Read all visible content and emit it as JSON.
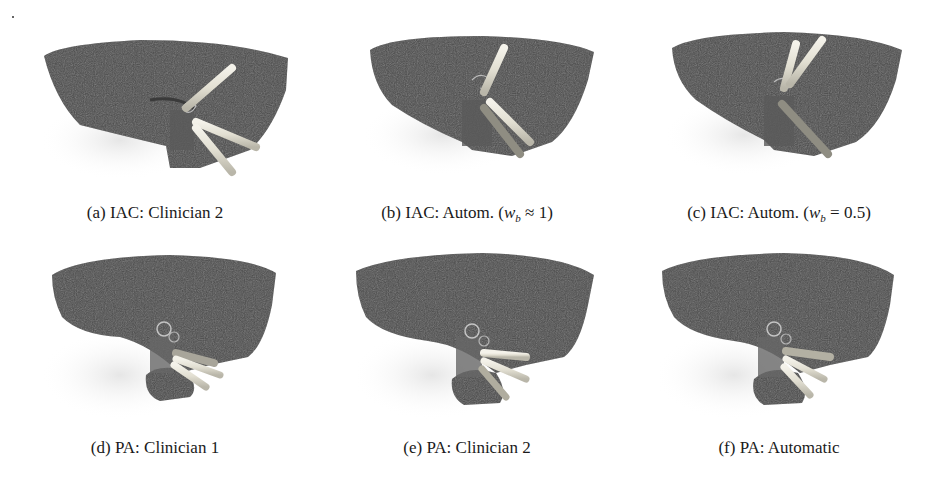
{
  "figure": {
    "panels": [
      {
        "id": "a",
        "label": "(a)",
        "text": "IAC: Clinician 2",
        "region": "IAC",
        "planner": "Clinician 2",
        "trajectory_count": 3
      },
      {
        "id": "b",
        "label": "(b)",
        "text": "IAC: Autom.",
        "math": "(w_b ≈ 1)",
        "math_var": "w",
        "math_sub": "b",
        "math_rel": "≈ 1",
        "region": "IAC",
        "planner": "Automatic",
        "trajectory_count": 3
      },
      {
        "id": "c",
        "label": "(c)",
        "text": "IAC: Autom.",
        "math": "(w_b = 0.5)",
        "math_var": "w",
        "math_sub": "b",
        "math_rel": "= 0.5",
        "region": "IAC",
        "planner": "Automatic",
        "trajectory_count": 3
      },
      {
        "id": "d",
        "label": "(d)",
        "text": "PA: Clinician 1",
        "region": "PA",
        "planner": "Clinician 1",
        "trajectory_count": 3
      },
      {
        "id": "e",
        "label": "(e)",
        "text": "PA: Clinician 2",
        "region": "PA",
        "planner": "Clinician 2",
        "trajectory_count": 3
      },
      {
        "id": "f",
        "label": "(f)",
        "text": "PA: Automatic",
        "region": "PA",
        "planner": "Automatic",
        "trajectory_count": 3
      }
    ],
    "colors": {
      "surface": "#4a4a4a",
      "surface_dark": "#333333",
      "trajectory": "#e6e3d6",
      "bone": "#d8d8d8",
      "background": "#ffffff"
    }
  }
}
